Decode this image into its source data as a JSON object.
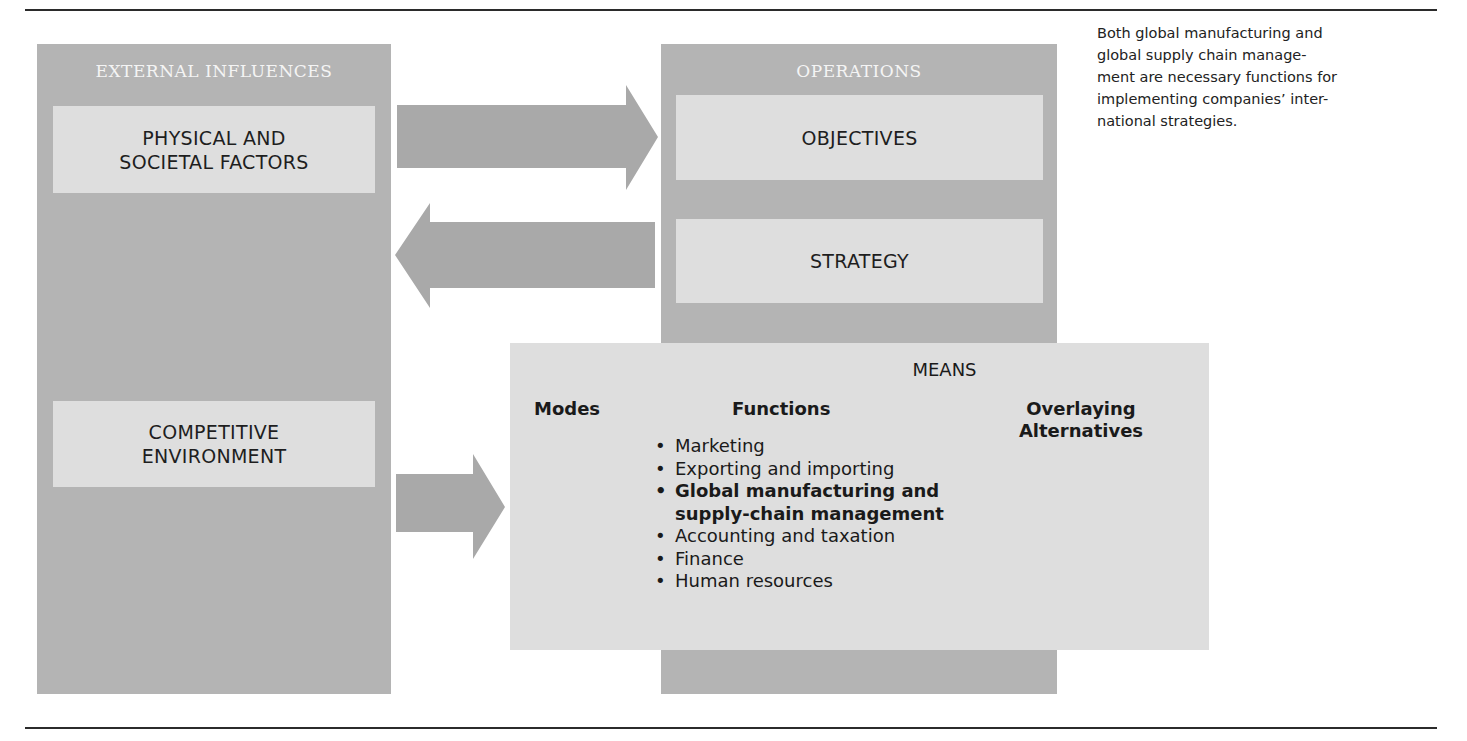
{
  "diagram": {
    "external": {
      "header": "EXTERNAL INFLUENCES",
      "physical": {
        "line1": "PHYSICAL AND",
        "line2": "SOCIETAL FACTORS"
      },
      "competitive": {
        "line1": "COMPETITIVE",
        "line2": "ENVIRONMENT"
      }
    },
    "operations": {
      "header": "OPERATIONS",
      "objectives": "OBJECTIVES",
      "strategy": "STRATEGY"
    },
    "means": {
      "title": "MEANS",
      "modes": "Modes",
      "functions": "Functions",
      "overlaying": {
        "line1": "Overlaying",
        "line2": "Alternatives"
      },
      "function_items": [
        {
          "text": "Marketing",
          "bold": false
        },
        {
          "text": "Exporting and importing",
          "bold": false
        },
        {
          "text": "Global manufacturing and",
          "bold": true
        },
        {
          "text": "supply-chain management",
          "bold": true,
          "continuation": true
        },
        {
          "text": "Accounting and taxation",
          "bold": false
        },
        {
          "text": "Finance",
          "bold": false
        },
        {
          "text": "Human resources",
          "bold": false
        }
      ],
      "bullet": "•"
    },
    "arrows": [
      {
        "from": "external-influences",
        "to": "operations",
        "direction": "right"
      },
      {
        "from": "operations",
        "to": "external-influences",
        "direction": "left"
      },
      {
        "from": "competitive-environment",
        "to": "means",
        "direction": "right"
      }
    ],
    "colors": {
      "outer": "#b4b4b4",
      "inner": "#dedede",
      "arrow": "#a9a9a9",
      "header_text": "#f4f4f4"
    }
  },
  "caption": {
    "text": "Both global manufacturing and global supply chain management are necessary functions for implementing companies’ international strategies.",
    "lines": [
      "Both global manufacturing and",
      "global supply chain manage-",
      "ment are necessary functions for",
      "implementing companies’ inter-",
      "national strategies."
    ]
  }
}
